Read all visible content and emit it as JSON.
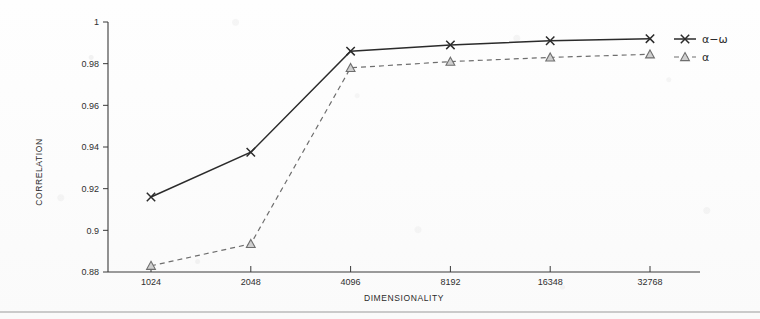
{
  "chart_data": {
    "type": "line",
    "title": "",
    "xlabel": "DIMENSIONALITY",
    "ylabel": "CORRELATION",
    "categories": [
      "1024",
      "2048",
      "4096",
      "8192",
      "16348",
      "32768"
    ],
    "x": [
      1024,
      2048,
      4096,
      8192,
      16348,
      32768
    ],
    "xtick_labels": [
      "1024",
      "2048",
      "4096",
      "8192",
      "16348",
      "32768"
    ],
    "ytick_labels": [
      "0.88",
      "0.9",
      "0.92",
      "0.94",
      "0.96",
      "0.98",
      "1"
    ],
    "yticks": [
      0.88,
      0.9,
      0.92,
      0.94,
      0.96,
      0.98,
      1
    ],
    "ylim": [
      0.88,
      1.0
    ],
    "grid": false,
    "legend_position": "top-right",
    "series": [
      {
        "name": "α−ω",
        "marker": "x",
        "linestyle": "solid",
        "color": "#2b2b2b",
        "values": [
          0.916,
          0.9375,
          0.986,
          0.989,
          0.991,
          0.992
        ]
      },
      {
        "name": "α",
        "marker": "triangle",
        "linestyle": "dashed",
        "color": "#6e6e6e",
        "values": [
          0.883,
          0.8935,
          0.978,
          0.981,
          0.983,
          0.9845
        ]
      }
    ]
  },
  "legend": {
    "entries": [
      {
        "label": "α−ω"
      },
      {
        "label": "α"
      }
    ]
  },
  "axes": {
    "x_title": "DIMENSIONALITY",
    "y_title": "CORRELATION"
  }
}
